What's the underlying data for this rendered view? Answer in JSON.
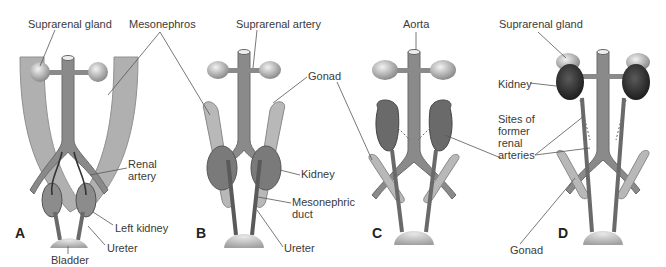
{
  "figure": {
    "panels": [
      {
        "id": "A",
        "letter": "A",
        "labels": {
          "suprarenal_gland": "Suprarenal gland",
          "mesonephros": "Mesonephros",
          "renal_artery": "Renal artery",
          "left_kidney": "Left kidney",
          "ureter": "Ureter",
          "bladder": "Bladder"
        }
      },
      {
        "id": "B",
        "letter": "B",
        "labels": {
          "suprarenal_artery": "Suprarenal artery",
          "gonad": "Gonad",
          "kidney": "Kidney",
          "mesonephric_duct": "Mesonephric duct",
          "ureter": "Ureter"
        }
      },
      {
        "id": "C",
        "letter": "C",
        "labels": {
          "aorta": "Aorta"
        }
      },
      {
        "id": "D",
        "letter": "D",
        "labels": {
          "suprarenal_gland": "Suprarenal gland",
          "kidney": "Kidney",
          "sites": "Sites of former renal arteries",
          "gonad": "Gonad"
        }
      }
    ],
    "colors": {
      "vessel": "#8c8c8c",
      "mesonephros": "#b5b5b5",
      "kidney": "#6e6e6e",
      "kidney_dark": "#3c3c3c",
      "gland": "#c8c8c8",
      "line": "#555555"
    }
  }
}
